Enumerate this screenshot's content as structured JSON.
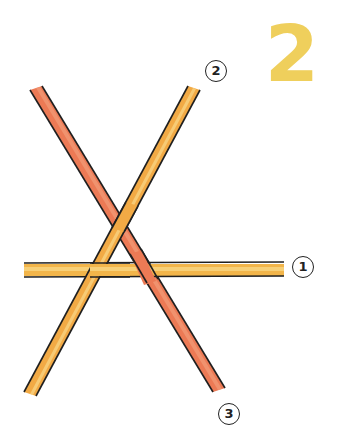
{
  "step": {
    "number": "2",
    "color": "#efcf5c"
  },
  "labels": [
    {
      "id": "1",
      "text": "1"
    },
    {
      "id": "2",
      "text": "2"
    },
    {
      "id": "3",
      "text": "3"
    }
  ],
  "sticks": [
    {
      "id": "1",
      "orientation": "horizontal",
      "color": "#f2b54a",
      "highlight": "#f9dc8c"
    },
    {
      "id": "2",
      "orientation": "diagonal-up-right",
      "color": "#f2aa45",
      "highlight": "#fad98a"
    },
    {
      "id": "3",
      "orientation": "diagonal-down-right",
      "color": "#ec7a55",
      "highlight": "#f4a27f"
    }
  ],
  "outline_color": "#1f1f1f"
}
